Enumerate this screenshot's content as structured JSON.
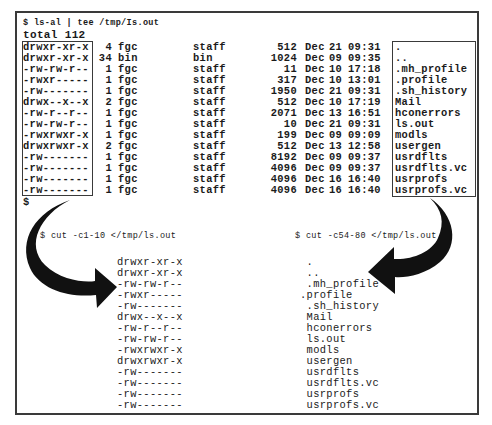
{
  "top": {
    "command": "$ ls-al | tee /tmp/Is.out",
    "total": "total 112",
    "prompt_after": "$",
    "rows": [
      {
        "perm": "drwxr-xr-x",
        "links": "4",
        "owner": "fgc",
        "group": "staff",
        "size": "512",
        "month": "Dec",
        "day": "21",
        "time": "09:31",
        "name": "."
      },
      {
        "perm": "drwxr-xr-x",
        "links": "34",
        "owner": "bin",
        "group": "bin",
        "size": "1024",
        "month": "Dec",
        "day": "09",
        "time": "09:35",
        "name": ".."
      },
      {
        "perm": "-rw-rw-r--",
        "links": "1",
        "owner": "fgc",
        "group": "staff",
        "size": "11",
        "month": "Dec",
        "day": "10",
        "time": "17:18",
        "name": ".mh_profile"
      },
      {
        "perm": "-rwxr-----",
        "links": "1",
        "owner": "fgc",
        "group": "staff",
        "size": "317",
        "month": "Dec",
        "day": "10",
        "time": "13:01",
        "name": ".profile"
      },
      {
        "perm": "-rw-------",
        "links": "1",
        "owner": "fgc",
        "group": "staff",
        "size": "1950",
        "month": "Dec",
        "day": "21",
        "time": "09:31",
        "name": ".sh_history"
      },
      {
        "perm": "drwx--x--x",
        "links": "2",
        "owner": "fgc",
        "group": "staff",
        "size": "512",
        "month": "Dec",
        "day": "10",
        "time": "17:19",
        "name": "Mail"
      },
      {
        "perm": "-rw-r--r--",
        "links": "1",
        "owner": "fgc",
        "group": "staff",
        "size": "2071",
        "month": "Dec",
        "day": "13",
        "time": "16:51",
        "name": "hconerrors"
      },
      {
        "perm": "-rw-rw-r--",
        "links": "1",
        "owner": "fgc",
        "group": "staff",
        "size": "10",
        "month": "Dec",
        "day": "21",
        "time": "09:31",
        "name": "ls.out"
      },
      {
        "perm": "-rwxrwxr-x",
        "links": "1",
        "owner": "fgc",
        "group": "staff",
        "size": "199",
        "month": "Dec",
        "day": "09",
        "time": "09:09",
        "name": "modls"
      },
      {
        "perm": "drwxrwxr-x",
        "links": "2",
        "owner": "fgc",
        "group": "staff",
        "size": "512",
        "month": "Dec",
        "day": "13",
        "time": "12:58",
        "name": "usergen"
      },
      {
        "perm": "-rw-------",
        "links": "1",
        "owner": "fgc",
        "group": "staff",
        "size": "8192",
        "month": "Dec",
        "day": "09",
        "time": "09:37",
        "name": "usrdflts"
      },
      {
        "perm": "-rw-------",
        "links": "1",
        "owner": "fgc",
        "group": "staff",
        "size": "4096",
        "month": "Dec",
        "day": "09",
        "time": "09:37",
        "name": "usrdflts.vc"
      },
      {
        "perm": "-rw-------",
        "links": "1",
        "owner": "fgc",
        "group": "staff",
        "size": "4096",
        "month": "Dec",
        "day": "16",
        "time": "16:40",
        "name": "usrprofs"
      },
      {
        "perm": "-rw-------",
        "links": "1",
        "owner": "fgc",
        "group": "staff",
        "size": "4096",
        "month": "Dec",
        "day": "16",
        "time": "16:40",
        "name": "usrprofs.vc"
      }
    ]
  },
  "cut_left": {
    "command": "$ cut -c1-10 </tmp/ls.out",
    "lines": [
      "drwxr-xr-x",
      "drwxr-xr-x",
      "-rw-rw-r--",
      "-rwxr-----",
      "-rw-------",
      "drwx--x--x",
      "-rw-r--r--",
      "-rw-rw-r--",
      "-rwxrwxr-x",
      "drwxrwxr-x",
      "-rw-------",
      "-rw-------",
      "-rw-------",
      "-rw-------"
    ]
  },
  "cut_right": {
    "command": "$ cut -c54-80 </tmp/ls.out",
    "lines": [
      " .",
      " ..",
      " .mh_profile",
      ".profile",
      " .sh_history",
      " Mail",
      " hconerrors",
      " ls.out",
      " modls",
      " usergen",
      " usrdflts",
      " usrdflts.vc",
      " usrprofs",
      " usrprofs.vc"
    ]
  },
  "colors": {
    "ink": "#1a1a1a",
    "frame": "#3a3a3a",
    "arrow": "#111111",
    "background": "#ffffff"
  }
}
